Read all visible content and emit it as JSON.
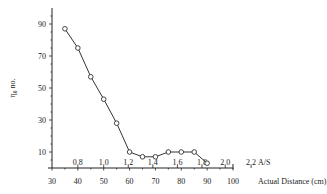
{
  "chart_data": {
    "type": "line",
    "title": "",
    "xlabel": "Actual Distance (cm)",
    "x2label": "A/S",
    "ylabel": "η₀ no.",
    "x": [
      35,
      40,
      45,
      50,
      55,
      60,
      65,
      70,
      75,
      80,
      85,
      90
    ],
    "series": [
      {
        "name": "η₀ no.",
        "values": [
          87,
          75,
          57,
          43,
          28,
          10,
          7,
          7,
          10,
          10,
          10,
          3
        ]
      }
    ],
    "xlim": [
      30,
      100
    ],
    "ylim": [
      0,
      100
    ],
    "x_ticks": [
      30,
      40,
      50,
      60,
      70,
      80,
      90,
      100
    ],
    "y_ticks": [
      10,
      30,
      50,
      70,
      90
    ],
    "x2_ticks": [
      "0.8",
      "1.0",
      "1.2",
      "1.4",
      "1.6",
      "1.8",
      "2.0",
      "2.2"
    ],
    "x2_tick_positions": [
      40,
      50,
      59.5,
      69,
      78.5,
      88,
      97,
      107
    ],
    "grid": false,
    "legend": "none",
    "marker": "open-circle"
  },
  "labels": {
    "y_axis": "η₀ no.",
    "x_axis": "Actual Distance (cm)",
    "x2_axis": "A/S"
  }
}
